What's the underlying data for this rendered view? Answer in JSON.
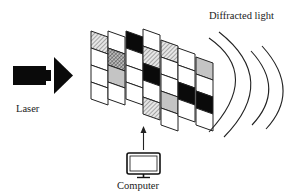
{
  "labels": {
    "laser": "Laser",
    "computer": "Computer",
    "diffracted": "Diffracted light"
  },
  "colors": {
    "stroke": "#222222",
    "black": "#0a0a0a",
    "gray": "#c4c4c4",
    "white": "#ffffff"
  },
  "grid": {
    "col_width": 17,
    "skew": 6,
    "columns": [
      {
        "x": 91,
        "y": 31,
        "row_h": 17,
        "cells": [
          "hatch",
          "white",
          "white",
          "white"
        ]
      },
      {
        "x": 108,
        "y": 31,
        "row_h": 17,
        "cells": [
          "white",
          "cross",
          "gray",
          "white"
        ]
      },
      {
        "x": 126,
        "y": 31,
        "row_h": 17,
        "cells": [
          "black",
          "white",
          "white",
          "white"
        ]
      },
      {
        "x": 143,
        "y": 29,
        "row_h": 17,
        "cells": [
          "white",
          "hatch",
          "black",
          "white",
          "hatch"
        ]
      },
      {
        "x": 161,
        "y": 40,
        "row_h": 17,
        "cells": [
          "hatch",
          "white",
          "white",
          "gray",
          "white"
        ]
      },
      {
        "x": 178,
        "y": 48,
        "row_h": 17,
        "cells": [
          "white",
          "white",
          "black",
          "white"
        ]
      },
      {
        "x": 196,
        "y": 57,
        "row_h": 17,
        "cells": [
          "gray",
          "white",
          "black",
          "white"
        ]
      }
    ]
  }
}
